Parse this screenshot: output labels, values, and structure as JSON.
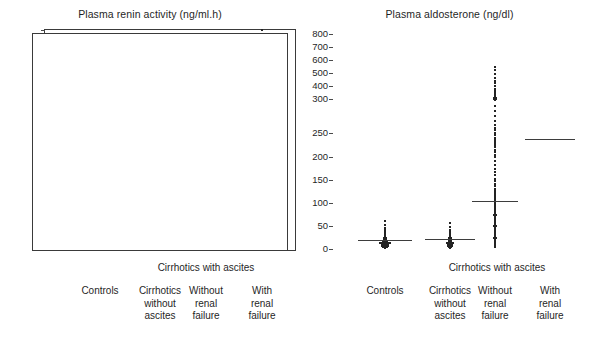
{
  "figure": {
    "background": "#ffffff",
    "dot_color": "#232323",
    "axis_color": "#3a3a3a",
    "median_color": "#3d3d3d"
  },
  "panels": [
    {
      "id": "plasma-renin-activity",
      "title": "Plasma renin activity (ng/ml.h)",
      "group_label": "Cirrhotics with ascites",
      "categories": [
        "Controls",
        "Cirrhotics\nwithout\nascites",
        "Without\nrenal\nfailure",
        "With\nrenal\nfailure"
      ]
    },
    {
      "id": "plasma-aldosterone",
      "title": "Plasma aldosterone (ng/dl)",
      "group_label": "Cirrhotics with ascites",
      "categories": [
        "Controls",
        "Cirrhotics\nwithout\nascites",
        "Without\nrenal\nfailure",
        "With\nrenal\nfailure"
      ]
    }
  ],
  "chart_data": [
    {
      "type": "scatter",
      "title": "Plasma renin activity (ng/ml.h)",
      "xlabel": "",
      "ylabel": "Plasma renin activity (ng/ml.h)",
      "grid": false,
      "legend": null,
      "axis_type": "broken",
      "yticks": [
        0,
        5,
        10,
        15,
        20,
        25,
        30,
        40,
        50,
        60,
        70
      ],
      "ytick_labels": [
        "0",
        "5",
        "10",
        "15",
        "20",
        "25",
        "30",
        "40",
        "50",
        "60",
        "70"
      ],
      "ylim": [
        0,
        70
      ],
      "break_value": 25,
      "categories": [
        "Controls",
        "Cirrhotics without ascites",
        "Without renal failure",
        "With renal failure"
      ],
      "series": [
        {
          "name": "Controls",
          "median": 1.1,
          "values": [
            0.2,
            0.2,
            0.3,
            0.3,
            0.3,
            0.4,
            0.4,
            0.4,
            0.5,
            0.5,
            0.5,
            0.5,
            0.6,
            0.6,
            0.6,
            0.7,
            0.7,
            0.7,
            0.8,
            0.8,
            0.8,
            0.9,
            0.9,
            0.9,
            1.0,
            1.0,
            1.0,
            1.1,
            1.1,
            1.1,
            1.2,
            1.2,
            1.3,
            1.3,
            1.4,
            1.5,
            1.6,
            1.7,
            1.9,
            2.1,
            2.4,
            3.4
          ]
        },
        {
          "name": "Cirrhotics without ascites",
          "median": 1.3,
          "values": [
            0.2,
            0.3,
            0.3,
            0.4,
            0.4,
            0.5,
            0.5,
            0.6,
            0.6,
            0.7,
            0.7,
            0.8,
            0.8,
            0.9,
            0.9,
            1.0,
            1.0,
            1.1,
            1.1,
            1.2,
            1.2,
            1.3,
            1.4,
            1.5,
            1.6,
            1.8,
            2.0,
            2.3,
            2.7,
            3.2,
            5.2
          ]
        },
        {
          "name": "Without renal failure",
          "median": 2.2,
          "values": [
            0.3,
            0.4,
            0.4,
            0.5,
            0.5,
            0.5,
            0.6,
            0.6,
            0.6,
            0.7,
            0.7,
            0.7,
            0.7,
            0.8,
            0.8,
            0.8,
            0.8,
            0.9,
            0.9,
            0.9,
            0.9,
            1.0,
            1.0,
            1.0,
            1.0,
            1.1,
            1.1,
            1.1,
            1.1,
            1.2,
            1.2,
            1.2,
            1.3,
            1.3,
            1.3,
            1.4,
            1.4,
            1.4,
            1.5,
            1.5,
            1.5,
            1.6,
            1.6,
            1.7,
            1.7,
            1.8,
            1.8,
            1.9,
            1.9,
            2.0,
            2.0,
            2.1,
            2.1,
            2.2,
            2.2,
            2.3,
            2.3,
            2.4,
            2.5,
            2.6,
            2.7,
            2.8,
            2.9,
            3.0,
            3.1,
            3.2,
            3.4,
            3.5,
            3.7,
            3.9,
            4.1,
            4.3,
            4.5,
            4.8,
            5.1,
            5.4,
            5.7,
            6.0,
            6.4,
            6.8,
            7.2,
            7.6,
            8.1,
            8.6,
            9.2,
            9.8,
            10.5,
            11.2,
            12.0,
            12.9,
            13.8,
            14.8,
            15.9,
            17.0,
            18.2,
            19.5,
            20.9,
            22.4,
            25.2,
            27.0,
            27.6,
            28.2,
            37.8,
            38.2,
            39.6,
            39.8
          ]
        },
        {
          "name": "With renal failure",
          "median": 20.1,
          "values": [
            1.1,
            1.4,
            1.7,
            2.0,
            2.3,
            2.6,
            3.0,
            3.4,
            3.9,
            4.4,
            4.9,
            5.0,
            5.1,
            5.3,
            5.6,
            6.0,
            7.3,
            8.2,
            9.0,
            9.9,
            10.2,
            10.4,
            10.6,
            10.9,
            11.5,
            12.6,
            13.8,
            15.1,
            16.5,
            17.4,
            18.3,
            19.2,
            20.4,
            21.5,
            22.6,
            23.8,
            26.2,
            28.0,
            28.4,
            28.8,
            30.5,
            32.3,
            35.8,
            38.2,
            40.5,
            43.0,
            45.5,
            49.5,
            56.2,
            70.1
          ]
        }
      ]
    },
    {
      "type": "scatter",
      "title": "Plasma aldosterone (ng/dl)",
      "xlabel": "",
      "ylabel": "Plasma aldosterone (ng/dl)",
      "grid": false,
      "legend": null,
      "axis_type": "broken",
      "yticks": [
        0,
        50,
        100,
        150,
        200,
        250,
        300,
        400,
        500,
        600,
        700,
        800
      ],
      "ytick_labels": [
        "0",
        "50",
        "100",
        "150",
        "200",
        "250",
        "300",
        "400",
        "500",
        "600",
        "700",
        "800"
      ],
      "ylim": [
        0,
        800
      ],
      "break_value": 250,
      "categories": [
        "Controls",
        "Cirrhotics without ascites",
        "Without renal failure",
        "With renal failure"
      ],
      "series": [
        {
          "name": "Controls",
          "median": 20,
          "values": [
            3,
            4,
            5,
            5,
            6,
            6,
            7,
            7,
            8,
            8,
            9,
            9,
            10,
            10,
            11,
            11,
            12,
            12,
            13,
            13,
            14,
            14,
            15,
            15,
            16,
            17,
            18,
            19,
            20,
            21,
            22,
            23,
            25,
            27,
            29,
            31,
            34,
            37,
            41,
            46,
            52,
            60
          ]
        },
        {
          "name": "Cirrhotics without ascites",
          "median": 21,
          "values": [
            3,
            4,
            5,
            6,
            6,
            7,
            8,
            8,
            9,
            10,
            10,
            11,
            12,
            12,
            13,
            14,
            15,
            16,
            17,
            18,
            19,
            20,
            21,
            23,
            25,
            27,
            30,
            33,
            37,
            42,
            48,
            57
          ]
        },
        {
          "name": "Without renal failure",
          "median": 105,
          "values": [
            5,
            7,
            9,
            11,
            13,
            15,
            17,
            19,
            21,
            23,
            25,
            27,
            29,
            31,
            33,
            35,
            37,
            39,
            41,
            43,
            45,
            47,
            49,
            51,
            53,
            55,
            57,
            59,
            61,
            63,
            65,
            67,
            69,
            71,
            73,
            75,
            77,
            79,
            81,
            83,
            85,
            88,
            91,
            94,
            97,
            100,
            103,
            106,
            110,
            114,
            118,
            122,
            126,
            131,
            136,
            141,
            147,
            153,
            160,
            167,
            175,
            183,
            192,
            201,
            205,
            210,
            215,
            220,
            225,
            230,
            232,
            234,
            236,
            240,
            245,
            250,
            255,
            258,
            262,
            268,
            275,
            282,
            290,
            298,
            300,
            302,
            305,
            310,
            320,
            332,
            345,
            360,
            380,
            400,
            420,
            440,
            465,
            490,
            520,
            550
          ]
        },
        {
          "name": "With renal failure",
          "median": 237
        }
      ]
    }
  ]
}
